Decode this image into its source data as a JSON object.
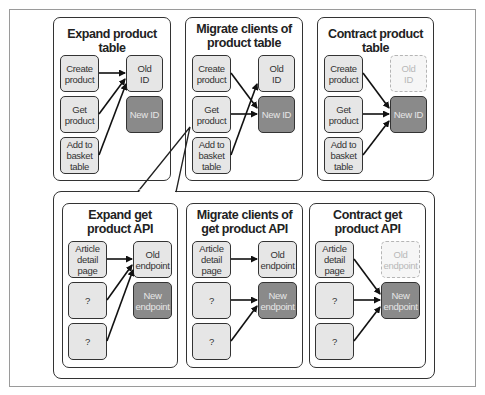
{
  "top_row": {
    "panels": [
      {
        "title": "Expand product table",
        "clients": [
          "Create product",
          "Get product",
          "Add to basket table"
        ],
        "targets": [
          {
            "label": "Old ID",
            "state": "active-old"
          },
          {
            "label": "New ID",
            "state": "new"
          }
        ],
        "arrows": [
          [
            "Create product",
            "Old ID"
          ],
          [
            "Get product",
            "Old ID"
          ],
          [
            "Add to basket table",
            "Old ID"
          ]
        ]
      },
      {
        "title": "Migrate clients of product table",
        "clients": [
          "Create product",
          "Get product",
          "Add to basket table"
        ],
        "targets": [
          {
            "label": "Old ID",
            "state": "active-old"
          },
          {
            "label": "New ID",
            "state": "new"
          }
        ],
        "arrows": [
          [
            "Create product",
            "New ID"
          ],
          [
            "Get product",
            "New ID"
          ],
          [
            "Add to basket table",
            "Old ID"
          ]
        ]
      },
      {
        "title": "Contract product table",
        "clients": [
          "Create product",
          "Get product",
          "Add to basket table"
        ],
        "targets": [
          {
            "label": "Old ID",
            "state": "removed"
          },
          {
            "label": "New ID",
            "state": "new"
          }
        ],
        "arrows": [
          [
            "Create product",
            "New ID"
          ],
          [
            "Get product",
            "New ID"
          ],
          [
            "Add to basket table",
            "New ID"
          ]
        ]
      }
    ]
  },
  "bottom_row": {
    "callout_from": "Get product (Migrate clients of product table)",
    "panels": [
      {
        "title": "Expand get product API",
        "clients": [
          "Article detail page",
          "?",
          "?"
        ],
        "targets": [
          {
            "label": "Old endpoint",
            "state": "active-old"
          },
          {
            "label": "New endpoint",
            "state": "new"
          }
        ],
        "arrows": [
          [
            "Article detail page",
            "Old endpoint"
          ],
          [
            "?",
            "Old endpoint"
          ],
          [
            "?",
            "Old endpoint"
          ]
        ]
      },
      {
        "title": "Migrate clients of get product API",
        "clients": [
          "Article detail page",
          "?",
          "?"
        ],
        "targets": [
          {
            "label": "Old endpoint",
            "state": "active-old"
          },
          {
            "label": "New endpoint",
            "state": "new"
          }
        ],
        "arrows": [
          [
            "Article detail page",
            "Old endpoint"
          ],
          [
            "?",
            "New endpoint"
          ],
          [
            "?",
            "New endpoint"
          ]
        ]
      },
      {
        "title": "Contract get product API",
        "clients": [
          "Article detail page",
          "?",
          "?"
        ],
        "targets": [
          {
            "label": "Old endpoint",
            "state": "removed"
          },
          {
            "label": "New endpoint",
            "state": "new"
          }
        ],
        "arrows": [
          [
            "Article detail page",
            "New endpoint"
          ],
          [
            "?",
            "New endpoint"
          ],
          [
            "?",
            "New endpoint"
          ]
        ]
      }
    ]
  },
  "colors": {
    "client_fill": "#e6e6e6",
    "new_fill": "#8a8a8a",
    "removed_border": "#b5b5b5",
    "stroke": "#333333"
  }
}
